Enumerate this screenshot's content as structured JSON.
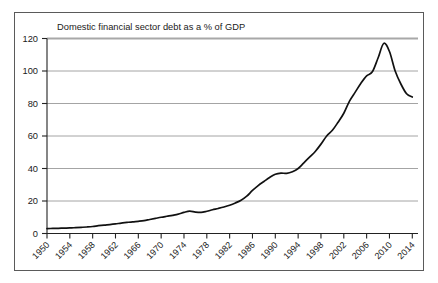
{
  "chart_data": {
    "type": "line",
    "title": "Domestic financial sector debt as a % of GDP",
    "xlabel": "",
    "ylabel": "",
    "xlim": [
      1950,
      2015
    ],
    "ylim": [
      0,
      120
    ],
    "grid": true,
    "legend_position": "none",
    "y_ticks": [
      0,
      20,
      40,
      60,
      80,
      100,
      120
    ],
    "y_tick_labels": [
      "0",
      "20",
      "40",
      "60",
      "80",
      "100",
      "120"
    ],
    "x_ticks": [
      1950,
      1954,
      1958,
      1962,
      1966,
      1970,
      1974,
      1978,
      1982,
      1986,
      1990,
      1994,
      1998,
      2002,
      2006,
      2010,
      2014
    ],
    "x_tick_labels": [
      "1950",
      "1954",
      "1958",
      "1962",
      "1966",
      "1970",
      "1974",
      "1978",
      "1982",
      "1986",
      "1990",
      "1994",
      "1998",
      "2002",
      "2006",
      "2010",
      "2014"
    ],
    "line_color": "#111111",
    "grid_color": "#9a9a9a",
    "series": [
      {
        "name": "Domestic financial sector debt (% of GDP)",
        "x": [
          1950,
          1951,
          1952,
          1953,
          1954,
          1955,
          1956,
          1957,
          1958,
          1959,
          1960,
          1961,
          1962,
          1963,
          1964,
          1965,
          1966,
          1967,
          1968,
          1969,
          1970,
          1971,
          1972,
          1973,
          1974,
          1975,
          1976,
          1977,
          1978,
          1979,
          1980,
          1981,
          1982,
          1983,
          1984,
          1985,
          1986,
          1987,
          1988,
          1989,
          1990,
          1991,
          1992,
          1993,
          1994,
          1995,
          1996,
          1997,
          1998,
          1999,
          2000,
          2001,
          2002,
          2003,
          2004,
          2005,
          2006,
          2007,
          2008,
          2009,
          2010,
          2011,
          2012,
          2013,
          2014
        ],
        "values": [
          3.0,
          3.1,
          3.2,
          3.3,
          3.4,
          3.6,
          3.8,
          4.0,
          4.3,
          4.8,
          5.2,
          5.5,
          5.9,
          6.4,
          6.8,
          7.2,
          7.5,
          7.9,
          8.6,
          9.3,
          10.0,
          10.6,
          11.2,
          11.9,
          13.0,
          13.8,
          13.2,
          13.0,
          13.7,
          14.6,
          15.4,
          16.3,
          17.4,
          18.8,
          20.5,
          23.0,
          26.5,
          29.5,
          32.0,
          34.5,
          36.5,
          37.2,
          37.0,
          38.0,
          40.0,
          43.5,
          47.0,
          50.5,
          55.0,
          60.0,
          63.5,
          68.5,
          74.0,
          81.5,
          87.0,
          92.5,
          97.0,
          99.5,
          108.0,
          117.0,
          112.0,
          100.0,
          92.0,
          86.0,
          84.0
        ]
      }
    ]
  }
}
